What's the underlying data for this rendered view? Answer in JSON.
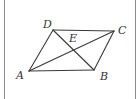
{
  "figure": {
    "kind": "geometry-diagram",
    "shape_name": "parallelogram",
    "background_color": "#ffffff",
    "stroke_color": "#3a3a3a",
    "rule_color": "#8a8a8a",
    "label_color": "#333333",
    "labels": {
      "a": "A",
      "b": "B",
      "c": "C",
      "d": "D",
      "e": "E"
    },
    "label_positions": {
      "a": {
        "x": 16,
        "y": 70
      },
      "b": {
        "x": 100,
        "y": 71
      },
      "c": {
        "x": 118,
        "y": 25
      },
      "d": {
        "x": 43,
        "y": 19
      },
      "e": {
        "x": 69,
        "y": 33
      }
    },
    "points": {
      "a": {
        "x": 29,
        "y": 71
      },
      "b": {
        "x": 94,
        "y": 70
      },
      "c": {
        "x": 114,
        "y": 31
      },
      "d": {
        "x": 53,
        "y": 30
      },
      "e": {
        "x": 77,
        "y": 49
      }
    },
    "segments": [
      {
        "name": "side-AB",
        "from": "a",
        "to": "b"
      },
      {
        "name": "side-BC",
        "from": "b",
        "to": "c"
      },
      {
        "name": "side-CD",
        "from": "c",
        "to": "d"
      },
      {
        "name": "side-DA",
        "from": "d",
        "to": "a"
      },
      {
        "name": "diagonal-AC",
        "from": "a",
        "to": "c"
      },
      {
        "name": "diagonal-BD",
        "from": "b",
        "to": "d"
      }
    ],
    "rules": [
      {
        "name": "rule-left",
        "x": 4
      },
      {
        "name": "rule-right",
        "x": 135
      }
    ]
  }
}
